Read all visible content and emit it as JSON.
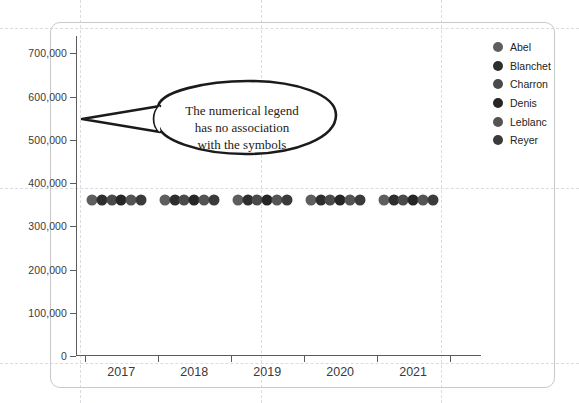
{
  "chart_data": {
    "type": "scatter",
    "title": "",
    "xlabel": "",
    "ylabel": "",
    "categories": [
      "2017",
      "2018",
      "2019",
      "2020",
      "2021"
    ],
    "yticks": [
      "0",
      "100,000",
      "200,000",
      "300,000",
      "400,000",
      "500,000",
      "600,000",
      "700,000"
    ],
    "ytick_values": [
      0,
      100000,
      200000,
      300000,
      400000,
      500000,
      600000,
      700000
    ],
    "ylim": [
      0,
      740000
    ],
    "grid": false,
    "legend_position": "right",
    "series": [
      {
        "name": "Abel",
        "color": "#5e5e5e",
        "values": [
          360000,
          360000,
          360000,
          360000,
          360000
        ]
      },
      {
        "name": "Blanchet",
        "color": "#2e2e2e",
        "values": [
          360000,
          360000,
          360000,
          360000,
          360000
        ]
      },
      {
        "name": "Charron",
        "color": "#4a4a4a",
        "values": [
          360000,
          360000,
          360000,
          360000,
          360000
        ]
      },
      {
        "name": "Denis",
        "color": "#262626",
        "values": [
          360000,
          360000,
          360000,
          360000,
          360000
        ]
      },
      {
        "name": "Leblanc",
        "color": "#545454",
        "values": [
          360000,
          360000,
          360000,
          360000,
          360000
        ]
      },
      {
        "name": "Reyer",
        "color": "#3b3b3b",
        "values": [
          360000,
          360000,
          360000,
          360000,
          360000
        ]
      }
    ],
    "annotations": [
      {
        "type": "callout",
        "text_lines": [
          "The numerical legend",
          "has no association",
          "with the symbols"
        ],
        "anchor_value": 500000
      }
    ]
  },
  "legend": {
    "items": [
      {
        "label": "Abel"
      },
      {
        "label": "Blanchet"
      },
      {
        "label": "Charron"
      },
      {
        "label": "Denis"
      },
      {
        "label": "Leblanc"
      },
      {
        "label": "Reyer"
      }
    ]
  },
  "callout": {
    "line1": "The numerical legend",
    "line2": "has no association",
    "line3": "with the symbols"
  },
  "axes": {
    "y_labels": [
      "700,000",
      "600,000",
      "500,000",
      "400,000",
      "300,000",
      "200,000",
      "100,000",
      "0"
    ],
    "x_labels": [
      "2017",
      "2018",
      "2019",
      "2020",
      "2021"
    ]
  },
  "colors": {
    "axis": "#5b5b5b",
    "frame": "#c9c9c9",
    "guide": "#d9dde2",
    "callout_stroke": "#1b1b1b"
  }
}
